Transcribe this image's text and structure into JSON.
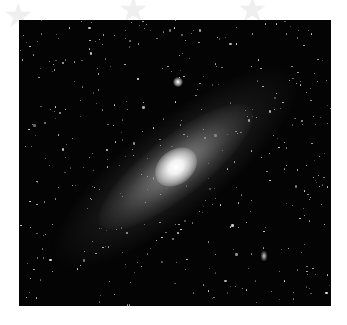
{
  "image": {
    "subject": "spiral galaxy (Andromeda-like) against a star field",
    "background_color": "#ffffff",
    "photo_background": "#040404"
  },
  "satellites": [
    {
      "name": "upper-satellite",
      "x": 159,
      "y": 62,
      "size": 10
    },
    {
      "name": "lower-satellite",
      "x": 245,
      "y": 236,
      "size": 8
    }
  ],
  "watermarks": [
    {
      "x": 3,
      "y": -2
    },
    {
      "x": 118,
      "y": -8
    },
    {
      "x": 237,
      "y": -8
    }
  ]
}
